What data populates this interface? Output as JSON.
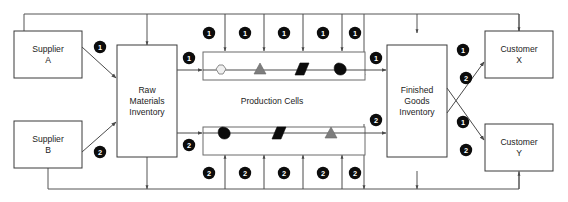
{
  "diagram": {
    "colors": {
      "badge_fill": "#0c0c0c",
      "badge_text": "#ffffff",
      "box_stroke": "#3a3a3a",
      "cell_stroke": "#6b6b6b",
      "line": "#4a4a4a",
      "hexagon_fill": "#efefef",
      "triangle_fill": "#7d7d7d",
      "parallelogram_fill": "#0c0c0c",
      "blob_fill": "#0c0c0c",
      "background": "#ffffff"
    }
  },
  "nodes": {
    "supplier_a": {
      "line1": "Supplier",
      "line2": "A"
    },
    "supplier_b": {
      "line1": "Supplier",
      "line2": "B"
    },
    "raw_materials": {
      "line1": "Raw",
      "line2": "Materials",
      "line3": "Inventory"
    },
    "finished_goods": {
      "line1": "Finished",
      "line2": "Goods",
      "line3": "Inventory"
    },
    "customer_x": {
      "line1": "Customer",
      "line2": "X"
    },
    "customer_y": {
      "line1": "Customer",
      "line2": "Y"
    },
    "production_cells_label": "Production Cells"
  },
  "badges": {
    "supplier_a_to_raw": "1",
    "supplier_b_to_raw": "2",
    "raw_to_cell_top": "1",
    "raw_to_cell_bottom": "2",
    "cell_top_to_finished": "1",
    "cell_bottom_to_finished": "2",
    "finished_to_customer_x": "1",
    "finished_to_customer_y": "2",
    "customer_x_return": "2",
    "customer_y_return": "1",
    "top_row": [
      "1",
      "1",
      "1",
      "1",
      "1"
    ],
    "bottom_row": [
      "2",
      "2",
      "2",
      "2",
      "2"
    ]
  },
  "production_cells": {
    "top_row": {
      "label": "top-production-cell",
      "operations": [
        {
          "name": "hexagon-operation",
          "shape": "hexagon",
          "fill": "#efefef"
        },
        {
          "name": "triangle-operation",
          "shape": "triangle",
          "fill": "#7d7d7d"
        },
        {
          "name": "parallelogram-operation",
          "shape": "parallelogram",
          "fill": "#0c0c0c"
        },
        {
          "name": "blob-operation",
          "shape": "blob",
          "fill": "#0c0c0c"
        }
      ]
    },
    "bottom_row": {
      "label": "bottom-production-cell",
      "operations": [
        {
          "name": "blob-operation",
          "shape": "blob",
          "fill": "#0c0c0c"
        },
        {
          "name": "parallelogram-operation",
          "shape": "parallelogram",
          "fill": "#0c0c0c"
        },
        {
          "name": "triangle-operation",
          "shape": "triangle",
          "fill": "#7d7d7d"
        }
      ]
    }
  }
}
